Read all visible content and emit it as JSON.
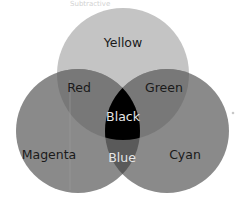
{
  "diagram": {
    "type": "venn",
    "caption_faint": "Subtractive",
    "circles": [
      {
        "name": "Yellow",
        "cx": 123,
        "cy": 74,
        "r": 66
      },
      {
        "name": "Magenta",
        "cx": 78,
        "cy": 131,
        "r": 62
      },
      {
        "name": "Cyan",
        "cx": 167,
        "cy": 131,
        "r": 62
      }
    ],
    "regions": {
      "yellow": {
        "label": "Yellow",
        "fill": "#c4c4c4",
        "text_color": "#1a1a1a"
      },
      "red": {
        "label": "Red",
        "fill": "#787878",
        "text_color": "#1a1a1a"
      },
      "green": {
        "label": "Green",
        "fill": "#787878",
        "text_color": "#1a1a1a"
      },
      "black": {
        "label": "Black",
        "fill": "#000000",
        "text_color": "#e6e6e6"
      },
      "magenta": {
        "label": "Magenta",
        "fill": "#8a8a8a",
        "text_color": "#1a1a1a"
      },
      "blue": {
        "label": "Blue",
        "fill": "#5a5a5a",
        "text_color": "#e6e6e6"
      },
      "cyan": {
        "label": "Cyan",
        "fill": "#8a8a8a",
        "text_color": "#1a1a1a"
      }
    }
  }
}
